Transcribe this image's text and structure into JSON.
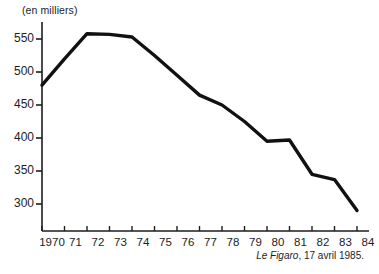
{
  "chart_data": {
    "type": "line",
    "title": "",
    "subtitle": "",
    "unit_label": "(en milliers)",
    "xlabel": "",
    "ylabel": "",
    "categories": [
      "1970",
      "71",
      "72",
      "73",
      "74",
      "75",
      "76",
      "77",
      "78",
      "79",
      "80",
      "81",
      "82",
      "83",
      "84"
    ],
    "x": [
      1970,
      1971,
      1972,
      1973,
      1974,
      1975,
      1976,
      1977,
      1978,
      1979,
      1980,
      1981,
      1982,
      1983,
      1984
    ],
    "values": [
      480,
      520,
      558,
      557,
      553,
      525,
      495,
      465,
      450,
      425,
      395,
      397,
      345,
      337,
      290
    ],
    "ylim": [
      270,
      575
    ],
    "xlim": [
      1970,
      1984
    ],
    "yticks": [
      300,
      350,
      400,
      450,
      500,
      550
    ],
    "ytick_labels": [
      "300",
      "350",
      "400",
      "450",
      "500",
      "550"
    ],
    "grid": false,
    "legend": null,
    "line_color": "#111111",
    "axis_color": "#1d1d1d",
    "background": "#ffffff"
  },
  "source": {
    "publication": "Le Figaro",
    "rest": ", 17 avril 1985."
  }
}
